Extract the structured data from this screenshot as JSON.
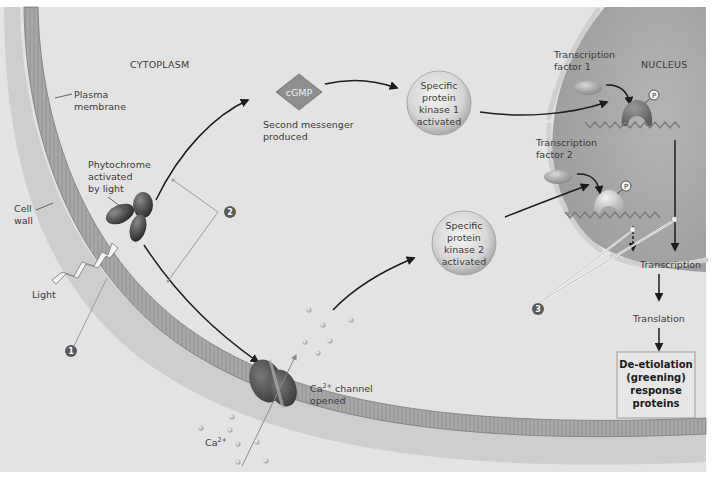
{
  "diagram": {
    "title_region_labels": {
      "cytoplasm": "CYTOPLASM",
      "nucleus": "NUCLEUS"
    },
    "structures": {
      "plasma_membrane": [
        "Plasma",
        "membrane"
      ],
      "cell_wall": [
        "Cell",
        "wall"
      ]
    },
    "receptor": {
      "label": [
        "Phytochrome",
        "activated",
        "by light"
      ]
    },
    "stimulus": {
      "label": "Light"
    },
    "second_messenger": {
      "symbol": "cGMP",
      "caption": [
        "Second messenger",
        "produced"
      ]
    },
    "kinase_1": {
      "lines": [
        "Specific",
        "protein",
        "kinase 1",
        "activated"
      ]
    },
    "kinase_2": {
      "lines": [
        "Specific",
        "protein",
        "kinase 2",
        "activated"
      ]
    },
    "calcium": {
      "ion": "Ca",
      "charge": "2+",
      "channel_caption_suffix": " channel",
      "channel_caption_line2": "opened"
    },
    "transcription_factor_1": [
      "Transcription",
      "factor 1"
    ],
    "transcription_factor_2": [
      "Transcription",
      "factor 2"
    ],
    "phosphate": "P",
    "process_steps": {
      "transcription": "Transcription",
      "translation": "Translation"
    },
    "response_box": {
      "lines": [
        "De-etiolation",
        "(greening)",
        "response",
        "proteins"
      ]
    },
    "step_markers": [
      "1",
      "2",
      "3"
    ],
    "colors": {
      "background": "#e4e4e4",
      "nucleus": "#a9a9a9",
      "membrane": "#9b9b9b",
      "cell_wall": "#c6c6c6",
      "arrow": "#1c1c1c",
      "step_marker": "#5a5a5a"
    }
  }
}
